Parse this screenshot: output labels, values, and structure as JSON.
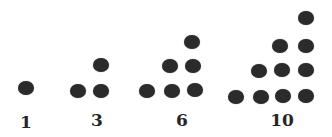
{
  "colors": {
    "dot": "#2b2b2b",
    "label": "#262626",
    "background": "#ffffff"
  },
  "groups": [
    {
      "label": "1",
      "label_pos": [
        26,
        122
      ],
      "dots": [
        [
          26,
          88
        ]
      ]
    },
    {
      "label": "3",
      "label_pos": [
        97,
        120
      ],
      "dots": [
        [
          78,
          91
        ],
        [
          101,
          91
        ],
        [
          101,
          65
        ]
      ]
    },
    {
      "label": "6",
      "label_pos": [
        182,
        120
      ],
      "dots": [
        [
          147,
          91
        ],
        [
          172,
          91
        ],
        [
          195,
          90
        ],
        [
          170,
          66
        ],
        [
          193,
          66
        ],
        [
          192,
          42
        ]
      ]
    },
    {
      "label": "10",
      "label_pos": [
        282,
        120
      ],
      "dots": [
        [
          236,
          97
        ],
        [
          261,
          97
        ],
        [
          283,
          96
        ],
        [
          306,
          96
        ],
        [
          259,
          71
        ],
        [
          282,
          70
        ],
        [
          306,
          70
        ],
        [
          280,
          46
        ],
        [
          306,
          46
        ],
        [
          306,
          18
        ]
      ]
    }
  ]
}
